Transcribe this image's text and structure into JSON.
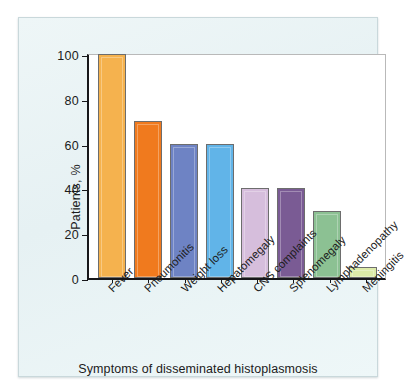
{
  "chart_data": {
    "type": "bar",
    "title": "",
    "categories": [
      "Fever",
      "Pneumonitis",
      "Weight loss",
      "Hepatomegaly",
      "CNS complaints",
      "Splenomegaly",
      "Lymphadenopathy",
      "Meningitis"
    ],
    "values": [
      100,
      70,
      60,
      60,
      40,
      40,
      30,
      5
    ],
    "bar_colors": [
      "#F5B24E",
      "#F07A1E",
      "#6E83C4",
      "#61B4E8",
      "#D6BEDC",
      "#7A5B94",
      "#8CC193",
      "#DCEBA8"
    ],
    "xlabel": "Symptoms of disseminated histoplasmosis",
    "ylabel": "Patients, %",
    "ylim": [
      0,
      100
    ],
    "yticks": [
      0,
      20,
      40,
      60,
      80,
      100
    ],
    "ytick_labels": [
      "0",
      "20",
      "40",
      "60",
      "80",
      "100"
    ],
    "grid": false,
    "legend": null,
    "xtick_label_rotation": -45
  },
  "figure": {
    "panel_background": "#eaf3f5",
    "plot_background": "#ffffff",
    "axis_color": "#17171a"
  }
}
